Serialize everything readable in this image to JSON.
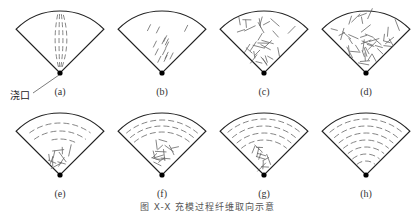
{
  "figure": {
    "gate_label": "浇口",
    "caption": "图 X-X 充模过程纤维取向示意",
    "panels": [
      {
        "id": "a",
        "label": "(a)",
        "pattern": "axial-streaks"
      },
      {
        "id": "b",
        "label": "(b)",
        "pattern": "diagonal-spread"
      },
      {
        "id": "c",
        "label": "(c)",
        "pattern": "random-partial"
      },
      {
        "id": "d",
        "label": "(d)",
        "pattern": "random-full"
      },
      {
        "id": "e",
        "label": "(e)",
        "pattern": "arcs-forming-top"
      },
      {
        "id": "f",
        "label": "(f)",
        "pattern": "arcs-top-random-bottom"
      },
      {
        "id": "g",
        "label": "(g)",
        "pattern": "arcs-mostly"
      },
      {
        "id": "h",
        "label": "(h)",
        "pattern": "concentric-arcs"
      }
    ],
    "colors": {
      "outline": "#222222",
      "fiber": "#666666",
      "gate": "#000000"
    }
  }
}
